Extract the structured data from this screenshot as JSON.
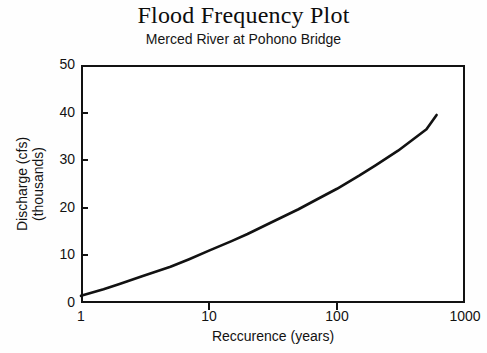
{
  "chart_data": {
    "type": "line",
    "title": "Flood Frequency Plot",
    "subtitle": "Merced River at Pohono Bridge",
    "xlabel": "Reccurence (years)",
    "ylabel_line1": "Discharge (cfs)",
    "ylabel_line2": "(thousands)",
    "xscale": "log",
    "yscale": "linear",
    "xlim": [
      1,
      1000
    ],
    "ylim": [
      0,
      50
    ],
    "grid": false,
    "legend": null,
    "xticks": [
      {
        "value": 1,
        "label": "1"
      },
      {
        "value": 10,
        "label": "10"
      },
      {
        "value": 100,
        "label": "100"
      },
      {
        "value": 1000,
        "label": "1000"
      }
    ],
    "yticks": [
      {
        "value": 0,
        "label": "0"
      },
      {
        "value": 10,
        "label": "10"
      },
      {
        "value": 20,
        "label": "20"
      },
      {
        "value": 30,
        "label": "30"
      },
      {
        "value": 40,
        "label": "40"
      },
      {
        "value": 50,
        "label": "50"
      }
    ],
    "series": [
      {
        "name": "Flood frequency curve",
        "color": "#121212",
        "x": [
          1,
          1.5,
          2,
          3,
          5,
          7,
          10,
          15,
          20,
          30,
          50,
          70,
          100,
          150,
          200,
          300,
          500,
          600
        ],
        "y": [
          1.5,
          2.9,
          4.0,
          5.6,
          7.6,
          9.2,
          11.0,
          13.0,
          14.5,
          16.8,
          19.7,
          21.8,
          24.0,
          26.8,
          28.9,
          32.0,
          36.5,
          39.5
        ]
      }
    ]
  }
}
